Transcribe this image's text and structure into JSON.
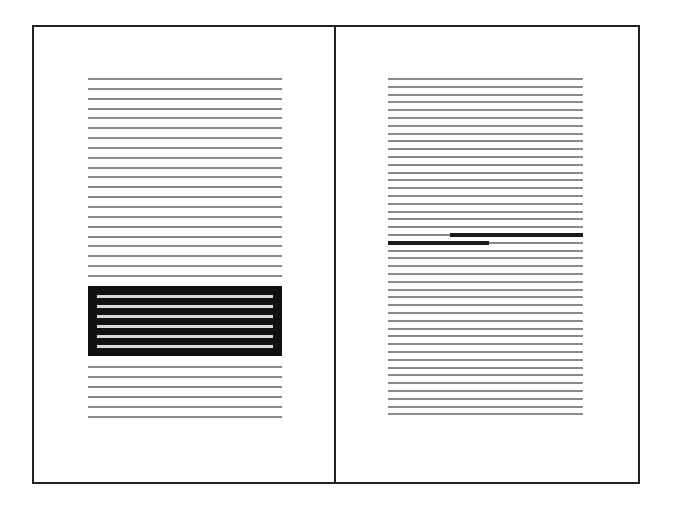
{
  "diagram": {
    "left_page": {
      "lines_above_block": 21,
      "highlighted_block_lines": 6,
      "lines_below_block": 6,
      "highlight_style": "inverted-block"
    },
    "right_page": {
      "total_lines": 44,
      "highlight_style": "bold-partial-lines",
      "highlights": [
        {
          "line_index": 20,
          "start_fraction": 0.32,
          "end_fraction": 1.0
        },
        {
          "line_index": 21,
          "start_fraction": 0.0,
          "end_fraction": 0.52
        }
      ]
    },
    "colors": {
      "border": "#222222",
      "text_line": "#8a8a8a",
      "block_bg": "#111111",
      "block_line": "#d8d8d8",
      "highlight": "#1a1a1a"
    }
  }
}
